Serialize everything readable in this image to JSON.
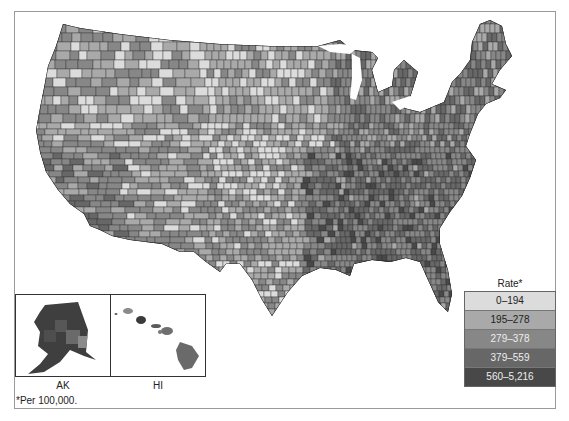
{
  "legend": {
    "title": "Rate*",
    "items": [
      {
        "label": "0–194",
        "color": "#dcdcdc",
        "text_color": "#222222"
      },
      {
        "label": "195–278",
        "color": "#a9a9a9",
        "text_color": "#222222"
      },
      {
        "label": "279–378",
        "color": "#878787",
        "text_color": "#eeeeee"
      },
      {
        "label": "379–559",
        "color": "#676767",
        "text_color": "#eeeeee"
      },
      {
        "label": "560–5,216",
        "color": "#484848",
        "text_color": "#eeeeee"
      }
    ]
  },
  "insets": {
    "ak_label": "AK",
    "hi_label": "HI"
  },
  "footnote": "*Per 100,000.",
  "map": {
    "type": "choropleth",
    "region": "United States counties",
    "palette": [
      "#dcdcdc",
      "#a9a9a9",
      "#878787",
      "#676767",
      "#484848"
    ]
  }
}
